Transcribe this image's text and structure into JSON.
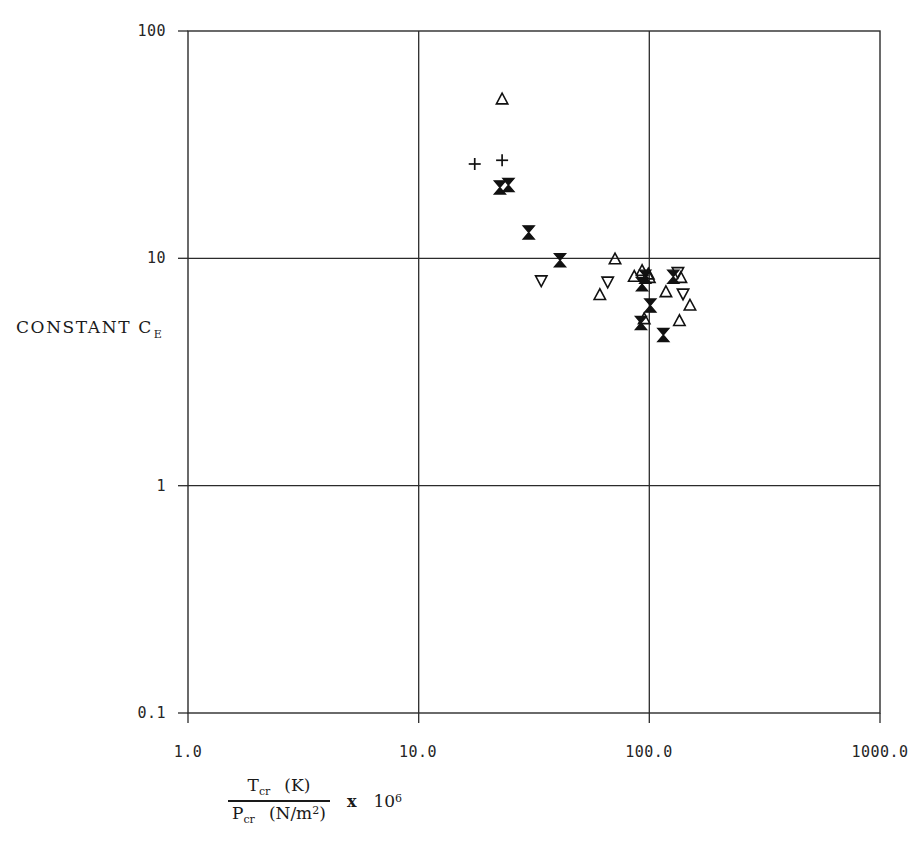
{
  "chart_data": {
    "type": "scatter",
    "title": "",
    "xlabel": "T_cr (K) / P_cr (N/m^2)  x 10^6",
    "ylabel": "CONSTANT C_E",
    "xscale": "log",
    "yscale": "log",
    "xlim": [
      1.0,
      1000.0
    ],
    "ylim": [
      0.1,
      100
    ],
    "grid": true,
    "legend": "none",
    "x_tick_labels": [
      "1.0",
      "10.0",
      "100.0",
      "1000.0"
    ],
    "x_tick_values": [
      1.0,
      10.0,
      100.0,
      1000.0
    ],
    "y_tick_labels": [
      "0.1",
      "1",
      "10",
      "100"
    ],
    "y_tick_values": [
      0.1,
      1,
      10,
      100
    ],
    "series": [
      {
        "name": "up-triangle",
        "marker": "triangle-up",
        "filled": false,
        "points": [
          {
            "x": 23.0,
            "y": 50.0
          },
          {
            "x": 71.0,
            "y": 9.9
          },
          {
            "x": 86.0,
            "y": 8.3
          },
          {
            "x": 93.0,
            "y": 8.8
          },
          {
            "x": 99.0,
            "y": 8.5
          },
          {
            "x": 100.0,
            "y": 8.2
          },
          {
            "x": 61.0,
            "y": 6.9
          },
          {
            "x": 118.0,
            "y": 7.1
          },
          {
            "x": 137.0,
            "y": 8.2
          },
          {
            "x": 150.0,
            "y": 6.2
          },
          {
            "x": 95.0,
            "y": 5.4
          },
          {
            "x": 135.0,
            "y": 5.3
          }
        ]
      },
      {
        "name": "down-triangle",
        "marker": "triangle-down",
        "filled": false,
        "points": [
          {
            "x": 34.0,
            "y": 8.0
          },
          {
            "x": 66.0,
            "y": 7.9
          },
          {
            "x": 133.0,
            "y": 8.7
          },
          {
            "x": 140.0,
            "y": 7.0
          }
        ]
      },
      {
        "name": "filled-bowtie",
        "marker": "bowtie",
        "filled": true,
        "points": [
          {
            "x": 22.5,
            "y": 20.5
          },
          {
            "x": 24.5,
            "y": 21.0
          },
          {
            "x": 30.0,
            "y": 13.0
          },
          {
            "x": 41.0,
            "y": 9.8
          },
          {
            "x": 96.0,
            "y": 8.3
          },
          {
            "x": 93.0,
            "y": 7.7
          },
          {
            "x": 127.0,
            "y": 8.3
          },
          {
            "x": 101.0,
            "y": 6.2
          },
          {
            "x": 92.0,
            "y": 5.2
          },
          {
            "x": 115.0,
            "y": 4.6
          }
        ]
      },
      {
        "name": "plus",
        "marker": "plus",
        "filled": false,
        "points": [
          {
            "x": 17.5,
            "y": 26.0
          },
          {
            "x": 23.0,
            "y": 27.0
          }
        ]
      }
    ]
  },
  "axes": {
    "y_title_text": "CONSTANT C",
    "y_title_sub": "E",
    "x_numerator_symbol": "T",
    "x_numerator_sub": "cr",
    "x_numerator_unit": "(K)",
    "x_denominator_symbol": "P",
    "x_denominator_sub": "cr",
    "x_denominator_unit_pre": "(N/m",
    "x_denominator_unit_sup": "2",
    "x_denominator_unit_post": ")",
    "x_multiplier_times": "x",
    "x_multiplier_base": "10",
    "x_multiplier_exp": "6"
  },
  "style": {
    "axis_color": "#1a1a1a",
    "grid_color": "#2b2b2b",
    "marker_color": "#111111",
    "background": "#ffffff"
  }
}
